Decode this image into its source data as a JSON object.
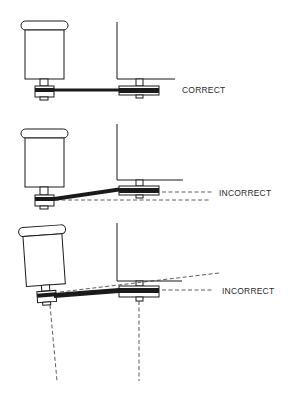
{
  "figure": {
    "colors": {
      "ink": "#1a1a1a",
      "background": "#ffffff",
      "label": "#2a2a2a"
    },
    "panels": [
      {
        "id": "panel-1",
        "label": "CORRECT",
        "condition": "pulleys aligned, belt level"
      },
      {
        "id": "panel-2",
        "label": "INCORRECT",
        "condition": "pulleys at different heights, belt slanted"
      },
      {
        "id": "panel-3",
        "label": "INCORRECT",
        "condition": "motor tilted, shafts not parallel"
      }
    ]
  }
}
